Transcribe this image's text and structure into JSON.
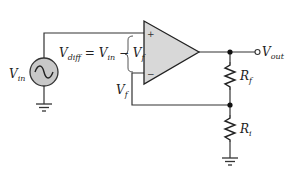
{
  "diagram": {
    "colors": {
      "wire": "#333333",
      "opamp_fill": "#d8d8d8",
      "source_fill": "#c8c8c8",
      "background": "#ffffff"
    },
    "labels": {
      "vin_main": "V",
      "vin_sub": "in",
      "vdiff_main": "V",
      "vdiff_sub": "diff",
      "vdiff_eq": " = V",
      "vdiff_eq_sub": "in",
      "vdiff_minus": " − V",
      "vdiff_minus_sub": "f",
      "vf_main": "V",
      "vf_sub": "f",
      "vout_main": "V",
      "vout_sub": "out",
      "rf_main": "R",
      "rf_sub": "f",
      "ri_main": "R",
      "ri_sub": "i",
      "plus": "+",
      "minus": "−"
    },
    "components": [
      {
        "type": "ac-source",
        "label": "Vin"
      },
      {
        "type": "op-amp",
        "inputs": [
          "+",
          "−"
        ]
      },
      {
        "type": "resistor",
        "label": "Rf"
      },
      {
        "type": "resistor",
        "label": "Ri"
      },
      {
        "type": "ground",
        "count": 2
      },
      {
        "type": "output-terminal",
        "label": "Vout"
      }
    ]
  }
}
